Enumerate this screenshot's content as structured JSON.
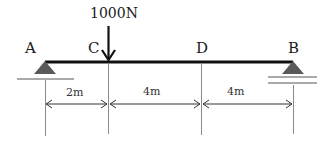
{
  "diagram": {
    "type": "simply-supported-beam",
    "points": {
      "A": {
        "label": "A",
        "x": 45
      },
      "C": {
        "label": "C",
        "x": 108
      },
      "D": {
        "label": "D",
        "x": 201
      },
      "B": {
        "label": "B",
        "x": 293
      }
    },
    "load": {
      "label": "1000N",
      "magnitude_n": 1000,
      "at_point": "C",
      "direction": "down"
    },
    "supports": {
      "A": {
        "type": "pin-icon"
      },
      "B": {
        "type": "roller-icon"
      }
    },
    "dimensions": [
      {
        "from": "A",
        "to": "C",
        "label": "2m"
      },
      {
        "from": "C",
        "to": "D",
        "label": "4m"
      },
      {
        "from": "D",
        "to": "B",
        "label": "4m"
      }
    ],
    "colors": {
      "beam": "#111111",
      "support": "#555555",
      "lines": "#666666",
      "text": "#1a1a1a"
    }
  }
}
